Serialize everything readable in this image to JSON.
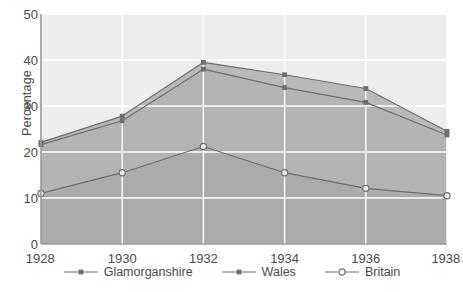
{
  "chart_data": {
    "type": "area",
    "title": "",
    "xlabel": "",
    "ylabel": "Percentage",
    "categories": [
      1928,
      1930,
      1932,
      1934,
      1936,
      1938
    ],
    "xtick_labels": [
      "1928",
      "1930",
      "1932",
      "1934",
      "1936",
      "1938"
    ],
    "ytick_labels": [
      "0",
      "10",
      "20",
      "30",
      "40",
      "50"
    ],
    "ytick_values": [
      0,
      10,
      20,
      30,
      40,
      50
    ],
    "ylim": [
      0,
      50
    ],
    "xlim": [
      1928,
      1938
    ],
    "grid": true,
    "grid_color": "#ffffff",
    "legend_position": "bottom",
    "series": [
      {
        "name": "Glamorganshire",
        "marker": "filled-square",
        "color": "#6e6e6e",
        "fill": "#b9b9b9",
        "values": [
          22.1,
          27.8,
          39.5,
          36.8,
          33.8,
          24.5
        ]
      },
      {
        "name": "Wales",
        "marker": "filled-square",
        "color": "#6e6e6e",
        "fill": "#b3b3b3",
        "values": [
          21.6,
          26.8,
          38.0,
          34.0,
          30.8,
          23.7
        ]
      },
      {
        "name": "Britain",
        "marker": "open-circle",
        "color": "#6e6e6e",
        "fill": "#ababab",
        "values": [
          11.0,
          15.5,
          21.2,
          15.5,
          12.1,
          10.5
        ]
      }
    ]
  },
  "legend": {
    "items": [
      {
        "label": "Glamorganshire",
        "marker": "filled-square"
      },
      {
        "label": "Wales",
        "marker": "filled-square"
      },
      {
        "label": "Britain",
        "marker": "open-circle"
      }
    ]
  },
  "colors": {
    "plot_background": "#ededed",
    "band_upper": "#b9b9b9",
    "band_middle": "#b3b3b3",
    "band_lower": "#ababab",
    "line": "#6e6e6e",
    "axis": "#9a9a9a",
    "grid": "#ffffff",
    "text": "#4a4a4a"
  }
}
